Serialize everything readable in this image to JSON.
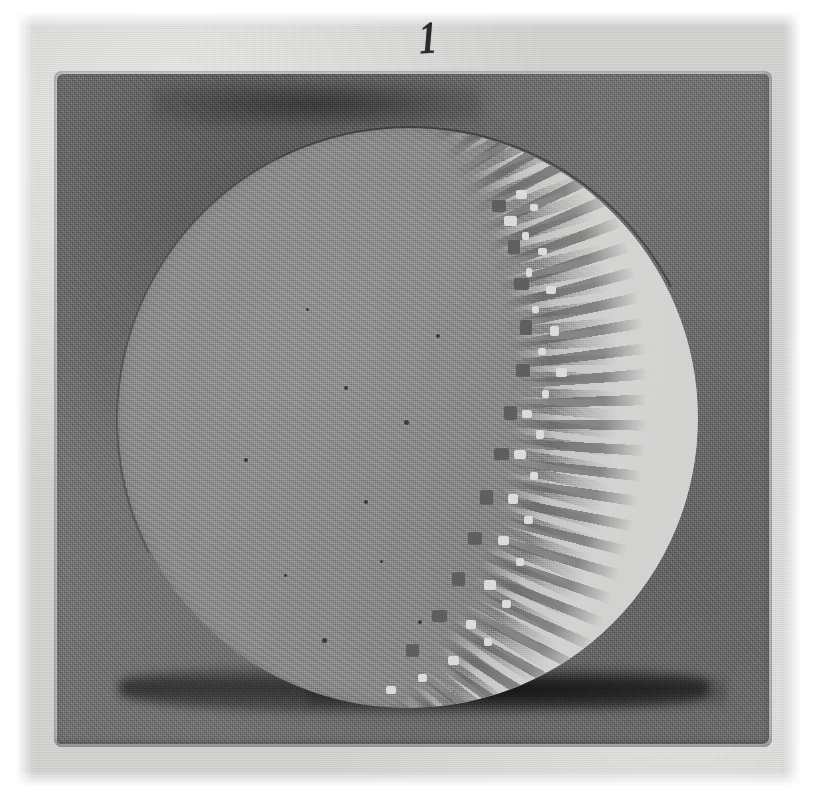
{
  "figure": {
    "number_label": "1",
    "caption": "",
    "plate_description": "dark square plate with circular specimen disc"
  },
  "colors": {
    "page_background": "#ffffff",
    "paper_field": "#d8d8d6",
    "plate_dark_square": "#6f6f6f",
    "plate_shadow": "#1a1a1a",
    "disc_body": "#8e8e8e",
    "disc_bright_crescent": "#d4d4d2",
    "disc_rim_line": "#2b2b2b",
    "figure_number_ink": "#2b2b2b"
  },
  "geometry": {
    "canvas_width": 817,
    "canvas_height": 798,
    "paper": {
      "left": 17,
      "top": 13,
      "width": 783,
      "height": 772
    },
    "plate": {
      "left": 57,
      "top": 74,
      "width": 712,
      "height": 670
    },
    "disc": {
      "left": 118,
      "top": 128,
      "diameter": 580,
      "center_x": 408,
      "center_y": 418,
      "radius": 290
    },
    "figure_number": {
      "left": 398,
      "top": 12
    }
  },
  "regions": {
    "upper_left_smudge": "darker ink band across the upper-left of the plate",
    "bottom_shadow_band": "dark horizontal shadow band along the lower edge of the plate",
    "bright_crescent": "illuminated crescent along the right limb of the disc",
    "terminator_zone": "jagged speckled boundary between the shaded disc body and the bright crescent"
  },
  "flecks": [
    {
      "x": 398,
      "y": 62,
      "w": 11,
      "h": 9
    },
    {
      "x": 412,
      "y": 76,
      "w": 8,
      "h": 7
    },
    {
      "x": 386,
      "y": 88,
      "w": 13,
      "h": 10
    },
    {
      "x": 404,
      "y": 104,
      "w": 7,
      "h": 8
    },
    {
      "x": 420,
      "y": 120,
      "w": 9,
      "h": 7
    },
    {
      "x": 408,
      "y": 140,
      "w": 6,
      "h": 9
    },
    {
      "x": 428,
      "y": 158,
      "w": 10,
      "h": 8
    },
    {
      "x": 414,
      "y": 178,
      "w": 7,
      "h": 7
    },
    {
      "x": 432,
      "y": 198,
      "w": 9,
      "h": 10
    },
    {
      "x": 420,
      "y": 220,
      "w": 8,
      "h": 7
    },
    {
      "x": 438,
      "y": 240,
      "w": 11,
      "h": 9
    },
    {
      "x": 424,
      "y": 262,
      "w": 7,
      "h": 8
    },
    {
      "x": 404,
      "y": 282,
      "w": 10,
      "h": 8
    },
    {
      "x": 418,
      "y": 302,
      "w": 8,
      "h": 9
    },
    {
      "x": 396,
      "y": 322,
      "w": 12,
      "h": 9
    },
    {
      "x": 412,
      "y": 344,
      "w": 8,
      "h": 8
    },
    {
      "x": 390,
      "y": 366,
      "w": 10,
      "h": 10
    },
    {
      "x": 406,
      "y": 388,
      "w": 9,
      "h": 8
    },
    {
      "x": 380,
      "y": 408,
      "w": 11,
      "h": 9
    },
    {
      "x": 398,
      "y": 430,
      "w": 8,
      "h": 8
    },
    {
      "x": 366,
      "y": 452,
      "w": 12,
      "h": 10
    },
    {
      "x": 384,
      "y": 472,
      "w": 9,
      "h": 8
    },
    {
      "x": 348,
      "y": 492,
      "w": 10,
      "h": 9
    },
    {
      "x": 366,
      "y": 510,
      "w": 8,
      "h": 8
    },
    {
      "x": 330,
      "y": 528,
      "w": 11,
      "h": 9
    },
    {
      "x": 300,
      "y": 546,
      "w": 9,
      "h": 8
    },
    {
      "x": 268,
      "y": 558,
      "w": 10,
      "h": 8
    }
  ],
  "dark_flecks": [
    {
      "x": 374,
      "y": 72,
      "w": 14,
      "h": 12
    },
    {
      "x": 390,
      "y": 112,
      "w": 12,
      "h": 14
    },
    {
      "x": 396,
      "y": 150,
      "w": 15,
      "h": 12
    },
    {
      "x": 402,
      "y": 192,
      "w": 12,
      "h": 15
    },
    {
      "x": 398,
      "y": 236,
      "w": 14,
      "h": 13
    },
    {
      "x": 386,
      "y": 278,
      "w": 13,
      "h": 14
    },
    {
      "x": 376,
      "y": 320,
      "w": 15,
      "h": 12
    },
    {
      "x": 362,
      "y": 362,
      "w": 13,
      "h": 15
    },
    {
      "x": 350,
      "y": 404,
      "w": 14,
      "h": 13
    },
    {
      "x": 334,
      "y": 444,
      "w": 13,
      "h": 14
    },
    {
      "x": 314,
      "y": 482,
      "w": 15,
      "h": 12
    },
    {
      "x": 288,
      "y": 516,
      "w": 13,
      "h": 13
    }
  ],
  "specks": [
    {
      "x": 286,
      "y": 292,
      "d": 5
    },
    {
      "x": 226,
      "y": 258,
      "d": 4
    },
    {
      "x": 246,
      "y": 372,
      "d": 4
    },
    {
      "x": 166,
      "y": 446,
      "d": 3
    },
    {
      "x": 318,
      "y": 206,
      "d": 4
    },
    {
      "x": 204,
      "y": 510,
      "d": 5
    },
    {
      "x": 126,
      "y": 330,
      "d": 4
    },
    {
      "x": 300,
      "y": 492,
      "d": 4
    },
    {
      "x": 188,
      "y": 180,
      "d": 3
    },
    {
      "x": 262,
      "y": 432,
      "d": 3
    }
  ]
}
